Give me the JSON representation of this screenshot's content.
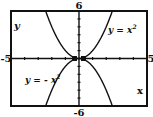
{
  "chart_data": {
    "type": "line",
    "title": "",
    "xlabel": "x",
    "ylabel": "y",
    "xlim": [
      -5,
      5
    ],
    "ylim": [
      -6,
      6
    ],
    "grid": false,
    "x_ticks_every": 1,
    "y_ticks_every": 1,
    "window_labels": {
      "xmin": "-5",
      "xmax": "5",
      "ymin": "-6",
      "ymax": "6"
    },
    "series": [
      {
        "name": "y = x²",
        "label": "y = x",
        "label_exp": "2",
        "expression": "x^2",
        "x": [
          -2.5,
          -2,
          -1.5,
          -1,
          -0.5,
          0,
          0.5,
          1,
          1.5,
          2,
          2.5
        ],
        "values": [
          6.25,
          4,
          2.25,
          1,
          0.25,
          0,
          0.25,
          1,
          2.25,
          4,
          6.25
        ]
      },
      {
        "name": "y = -x²",
        "label": "y = - x",
        "label_exp": "2",
        "expression": "-x^2",
        "x": [
          -2.5,
          -2,
          -1.5,
          -1,
          -0.5,
          0,
          0.5,
          1,
          1.5,
          2,
          2.5
        ],
        "values": [
          -6.25,
          -4,
          -2.25,
          -1,
          -0.25,
          0,
          -0.25,
          -1,
          -2.25,
          -4,
          -6.25
        ]
      }
    ],
    "annotations": [
      "y = x²",
      "y = - x²"
    ]
  },
  "colors": {
    "ink": "#111111",
    "background": "#ffffff"
  }
}
